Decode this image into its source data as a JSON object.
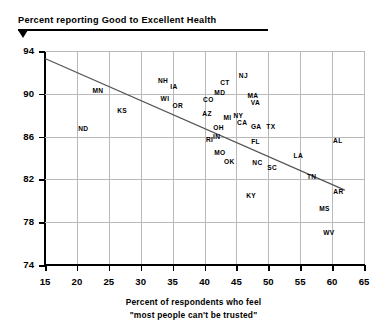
{
  "title": {
    "text": "Percent reporting Good to Excellent Health",
    "marker_icon": "down-triangle-icon"
  },
  "axis_caption": {
    "line1": "Percent of respondents who feel",
    "line2": "\"most people can't be trusted\""
  },
  "colors": {
    "background": "#ffffff",
    "text": "#000000",
    "grid": "#b9b9b9",
    "axis": "#000000",
    "trendline": "#555555"
  },
  "chart_data": {
    "type": "scatter",
    "title": "Percent reporting Good to Excellent Health",
    "xlabel": "Percent of respondents who feel \"most people can't be trusted\"",
    "ylabel": "Percent reporting Good to Excellent Health",
    "xlim": [
      15,
      65
    ],
    "ylim": [
      74,
      94
    ],
    "xticks": [
      15,
      20,
      25,
      30,
      35,
      40,
      45,
      50,
      55,
      60,
      65
    ],
    "yticks": [
      74,
      78,
      82,
      86,
      90,
      94
    ],
    "grid": true,
    "legend": "none",
    "point_style": "state-abbreviation-labels",
    "trendline": {
      "visible": true,
      "x_start": 15,
      "y_start": 93.3,
      "x_end": 62,
      "y_end": 81.0
    },
    "points": [
      {
        "label": "ND",
        "x": 21.0,
        "y": 86.8
      },
      {
        "label": "MN",
        "x": 23.3,
        "y": 90.4
      },
      {
        "label": "KS",
        "x": 27.1,
        "y": 88.5
      },
      {
        "label": "NH",
        "x": 33.5,
        "y": 91.3
      },
      {
        "label": "WI",
        "x": 33.8,
        "y": 89.6
      },
      {
        "label": "IA",
        "x": 35.2,
        "y": 90.7
      },
      {
        "label": "OR",
        "x": 35.8,
        "y": 89.0
      },
      {
        "label": "CO",
        "x": 40.6,
        "y": 89.5
      },
      {
        "label": "AZ",
        "x": 40.4,
        "y": 88.2
      },
      {
        "label": "RI",
        "x": 40.8,
        "y": 85.8
      },
      {
        "label": "OH",
        "x": 42.2,
        "y": 86.9
      },
      {
        "label": "IN",
        "x": 41.9,
        "y": 86.1
      },
      {
        "label": "MO",
        "x": 42.4,
        "y": 84.6
      },
      {
        "label": "MD",
        "x": 42.4,
        "y": 90.2
      },
      {
        "label": "CT",
        "x": 43.2,
        "y": 91.1
      },
      {
        "label": "MI",
        "x": 43.6,
        "y": 87.8
      },
      {
        "label": "OK",
        "x": 43.9,
        "y": 83.7
      },
      {
        "label": "NY",
        "x": 45.3,
        "y": 88.0
      },
      {
        "label": "CA",
        "x": 45.9,
        "y": 87.4
      },
      {
        "label": "NJ",
        "x": 46.1,
        "y": 91.8
      },
      {
        "label": "MA",
        "x": 47.6,
        "y": 89.9
      },
      {
        "label": "KY",
        "x": 47.3,
        "y": 80.5
      },
      {
        "label": "FL",
        "x": 48.0,
        "y": 85.6
      },
      {
        "label": "VA",
        "x": 48.0,
        "y": 89.2
      },
      {
        "label": "GA",
        "x": 48.1,
        "y": 87.0
      },
      {
        "label": "NC",
        "x": 48.3,
        "y": 83.6
      },
      {
        "label": "TX",
        "x": 50.4,
        "y": 87.0
      },
      {
        "label": "SC",
        "x": 50.6,
        "y": 83.2
      },
      {
        "label": "LA",
        "x": 54.7,
        "y": 84.3
      },
      {
        "label": "TN",
        "x": 56.8,
        "y": 82.3
      },
      {
        "label": "MS",
        "x": 58.8,
        "y": 79.3
      },
      {
        "label": "WV",
        "x": 59.5,
        "y": 77.1
      },
      {
        "label": "AL",
        "x": 60.9,
        "y": 85.7
      },
      {
        "label": "AR",
        "x": 61.0,
        "y": 80.9
      }
    ]
  }
}
